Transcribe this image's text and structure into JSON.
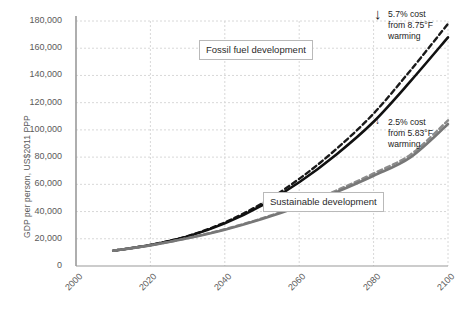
{
  "chart_data": {
    "type": "line",
    "title": "",
    "xlabel": "",
    "ylabel": "GDP per person, US$2011 PPP",
    "xlim": [
      2000,
      2100
    ],
    "ylim": [
      0,
      180000
    ],
    "grid": true,
    "legend_position": "inline-callouts",
    "xticks": [
      "2000",
      "2020",
      "2040",
      "2060",
      "2080",
      "2100"
    ],
    "yticks": [
      "0",
      "20,000",
      "40,000",
      "60,000",
      "80,000",
      "100,000",
      "120,000",
      "140,000",
      "160,000",
      "180,000"
    ],
    "x": [
      2010,
      2020,
      2030,
      2040,
      2050,
      2060,
      2070,
      2080,
      2090,
      2100
    ],
    "series": [
      {
        "name": "Fossil fuel development, no damages",
        "style": "dashed",
        "color": "#1a1a1a",
        "values": [
          11200,
          15500,
          22000,
          32000,
          46000,
          64000,
          86000,
          112000,
          144000,
          178000
        ]
      },
      {
        "name": "Fossil fuel development, with damages",
        "style": "solid",
        "color": "#111111",
        "values": [
          11200,
          15400,
          21700,
          31300,
          44600,
          61500,
          82000,
          106000,
          136000,
          168000
        ]
      },
      {
        "name": "Sustainable development, no damages",
        "style": "dashed",
        "color": "#8c8c8c",
        "values": [
          11200,
          15200,
          20500,
          27000,
          35000,
          44500,
          55500,
          68000,
          82000,
          107000
        ]
      },
      {
        "name": "Sustainable development, with damages",
        "style": "solid",
        "color": "#777777",
        "values": [
          11200,
          15150,
          20350,
          26700,
          34500,
          43700,
          54300,
          66300,
          80000,
          104300
        ]
      }
    ],
    "callouts": [
      {
        "id": "fossil",
        "label": "Fossil fuel development"
      },
      {
        "id": "sustainable",
        "label": "Sustainable\ndevelopment"
      }
    ],
    "annotations": [
      {
        "id": "fossil",
        "arrow": "↓",
        "text": "5.7% cost\nfrom 8.75°F\nwarming"
      },
      {
        "id": "sustainable",
        "arrow": "↓",
        "text": "2.5% cost\nfrom 5.83°F\nwarming"
      }
    ]
  },
  "axis": {
    "ylabel": "GDP per person, US$2011 PPP"
  },
  "callouts": {
    "fossil": "Fossil fuel development",
    "sustainable": "Sustainable\ndevelopment"
  },
  "annotations": {
    "fossil_arrow": "↓",
    "fossil_text": "5.7% cost\nfrom 8.75°F\nwarming",
    "sustainable_arrow": "↓",
    "sustainable_text": "2.5% cost\nfrom 5.83°F\nwarming"
  },
  "colors": {
    "fossil": "#111111",
    "sustainable": "#777777",
    "grid": "#d8d8d8",
    "axis": "#9a9a9a"
  }
}
